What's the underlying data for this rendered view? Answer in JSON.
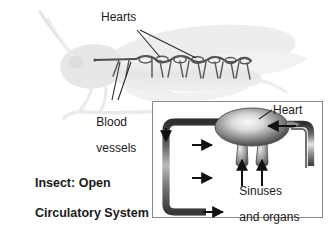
{
  "figure": {
    "title_line1": "Insect: Open",
    "title_line2": "Circulatory System",
    "title_full": "Insect: Open Circulatory System",
    "background_color": "#ffffff",
    "width": 335,
    "height": 235
  },
  "main_diagram": {
    "organism": "grasshopper",
    "silhouette_color": "#e9e9e9",
    "vessel_color": "#4a4a4a",
    "labels": {
      "hearts": "Hearts",
      "blood_vessels_line1": "Blood",
      "blood_vessels_line2": "vessels",
      "blood_vessels_full": "Blood vessels"
    },
    "heart_chamber_count": 7
  },
  "inset": {
    "border_color": "#8a8a8a",
    "background_color": "#ffffff",
    "labels": {
      "heart": "Heart",
      "sinuses_line1": "Sinuses",
      "sinuses_line2": "and organs",
      "sinuses_full": "Sinuses and organs"
    },
    "flow_arrow_count_right": 3,
    "flow_arrow_count_up": 2,
    "flow_arrow_count_down": 1
  },
  "colors": {
    "text": "#1a1a1a",
    "tube_dark": "#3c3c3c",
    "tube_light": "#d8d8d8",
    "heart_fill_center": "#f2f2f2",
    "heart_fill_edge": "#5a5a5a",
    "arrow": "#111111",
    "silhouette": "#e9e9e9"
  }
}
